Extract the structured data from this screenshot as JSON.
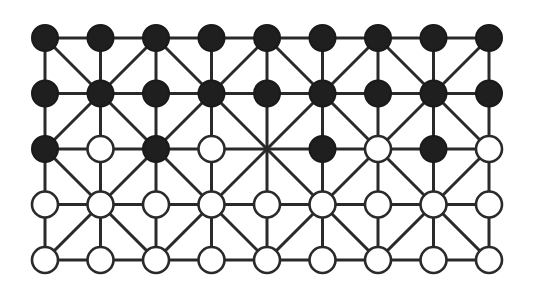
{
  "game": {
    "name": "Alquerque-style board (9x5)",
    "columns": 9,
    "rows": 5,
    "origin": {
      "x": 45,
      "y": 38
    },
    "spacing": {
      "x": 55.5,
      "y": 55.5
    },
    "piece_radius": 13,
    "diagonal_rule": "diagonals through points where (col+row) is even",
    "colors": {
      "line": "#2a2a2a",
      "black_piece": "#1f1f1f",
      "white_piece": "#ffffff",
      "background": "#ffffff"
    },
    "board": [
      [
        "B",
        "B",
        "B",
        "B",
        "B",
        "B",
        "B",
        "B",
        "B"
      ],
      [
        "B",
        "B",
        "B",
        "B",
        "B",
        "B",
        "B",
        "B",
        "B"
      ],
      [
        "B",
        "W",
        "B",
        "W",
        ".",
        "B",
        "W",
        "B",
        "W"
      ],
      [
        "W",
        "W",
        "W",
        "W",
        "W",
        "W",
        "W",
        "W",
        "W"
      ],
      [
        "W",
        "W",
        "W",
        "W",
        "W",
        "W",
        "W",
        "W",
        "W"
      ]
    ],
    "legend": {
      "B": "black piece",
      "W": "white piece",
      ".": "empty point"
    },
    "counts": {
      "black": 22,
      "white": 22,
      "empty": 1
    }
  }
}
